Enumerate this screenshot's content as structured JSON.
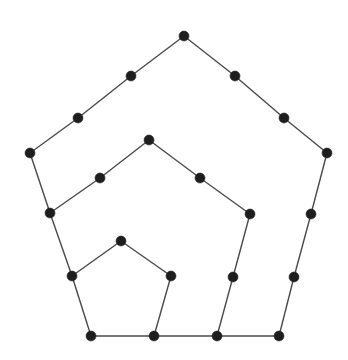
{
  "diagram": {
    "type": "graph",
    "colors": {
      "edge": "#4a4a4a",
      "node": "#1e1e1e",
      "background": "#ffffff"
    },
    "node_radius": 5,
    "nodes": [
      {
        "id": "n1",
        "x": 184,
        "y": 36
      },
      {
        "id": "n2",
        "x": 131,
        "y": 76
      },
      {
        "id": "n3",
        "x": 78,
        "y": 118
      },
      {
        "id": "n4",
        "x": 30,
        "y": 153
      },
      {
        "id": "n5",
        "x": 235,
        "y": 76
      },
      {
        "id": "n6",
        "x": 284,
        "y": 118
      },
      {
        "id": "n7",
        "x": 327,
        "y": 153
      },
      {
        "id": "n8",
        "x": 149,
        "y": 140
      },
      {
        "id": "n9",
        "x": 100,
        "y": 178
      },
      {
        "id": "n10",
        "x": 200,
        "y": 178
      },
      {
        "id": "n11",
        "x": 50,
        "y": 213
      },
      {
        "id": "n12",
        "x": 250,
        "y": 214
      },
      {
        "id": "n13",
        "x": 311,
        "y": 214
      },
      {
        "id": "n14",
        "x": 121,
        "y": 241
      },
      {
        "id": "n15",
        "x": 72,
        "y": 276
      },
      {
        "id": "n16",
        "x": 171,
        "y": 276
      },
      {
        "id": "n17",
        "x": 233,
        "y": 277
      },
      {
        "id": "n18",
        "x": 294,
        "y": 277
      },
      {
        "id": "n19",
        "x": 91,
        "y": 336
      },
      {
        "id": "n20",
        "x": 154,
        "y": 336
      },
      {
        "id": "n21",
        "x": 217,
        "y": 336
      },
      {
        "id": "n22",
        "x": 279,
        "y": 336
      }
    ],
    "edges": [
      [
        "n1",
        "n2"
      ],
      [
        "n2",
        "n3"
      ],
      [
        "n3",
        "n4"
      ],
      [
        "n4",
        "n11"
      ],
      [
        "n11",
        "n15"
      ],
      [
        "n15",
        "n19"
      ],
      [
        "n1",
        "n5"
      ],
      [
        "n5",
        "n6"
      ],
      [
        "n6",
        "n7"
      ],
      [
        "n7",
        "n13"
      ],
      [
        "n13",
        "n18"
      ],
      [
        "n18",
        "n22"
      ],
      [
        "n19",
        "n20"
      ],
      [
        "n20",
        "n21"
      ],
      [
        "n21",
        "n22"
      ],
      [
        "n11",
        "n9"
      ],
      [
        "n9",
        "n8"
      ],
      [
        "n8",
        "n10"
      ],
      [
        "n10",
        "n12"
      ],
      [
        "n12",
        "n17"
      ],
      [
        "n17",
        "n21"
      ],
      [
        "n15",
        "n14"
      ],
      [
        "n14",
        "n16"
      ],
      [
        "n16",
        "n20"
      ]
    ]
  }
}
